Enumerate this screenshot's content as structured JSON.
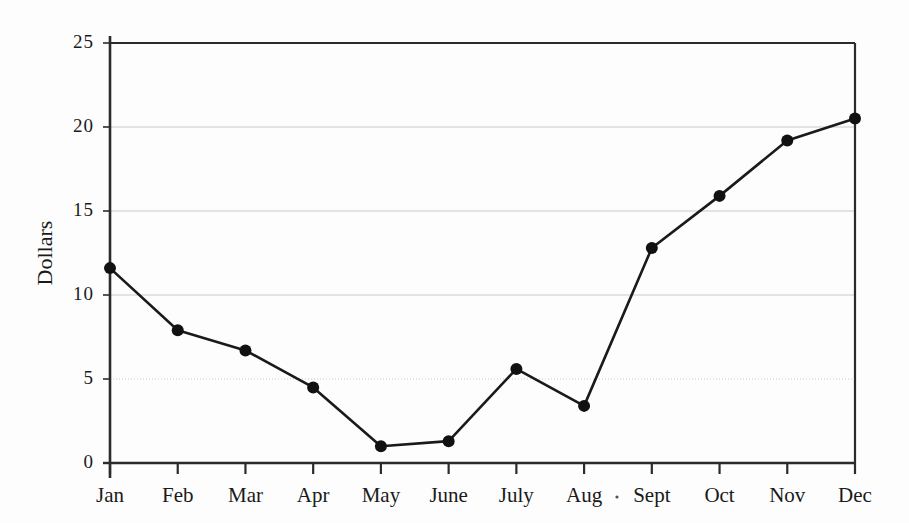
{
  "chart_data": {
    "type": "line",
    "title": "",
    "xlabel": "",
    "ylabel": "Dollars",
    "categories": [
      "Jan",
      "Feb",
      "Mar",
      "Apr",
      "May",
      "June",
      "July",
      "Aug",
      "Sept",
      "Oct",
      "Nov",
      "Dec"
    ],
    "values": [
      11.6,
      7.9,
      6.7,
      4.5,
      1.0,
      1.3,
      5.6,
      3.4,
      12.8,
      15.9,
      19.2,
      20.5
    ],
    "series": [
      {
        "name": "Dollars",
        "values": [
          11.6,
          7.9,
          6.7,
          4.5,
          1.0,
          1.3,
          5.6,
          3.4,
          12.8,
          15.9,
          19.2,
          20.5
        ]
      }
    ],
    "ylim": [
      0,
      25
    ],
    "yticks": [
      0,
      5,
      10,
      15,
      20,
      25
    ],
    "ytick_labels": [
      "0",
      "5",
      "10",
      "15",
      "20",
      "25"
    ],
    "grid": true,
    "gridlines_at": [
      5,
      10,
      15,
      20
    ],
    "legend": "none",
    "marker": "filled-circle",
    "line_color": "#1a1a1a",
    "marker_color": "#111111",
    "grid_color": "#c9c9c9",
    "axis_color": "#2b2b2b",
    "background": "#fdfdfd"
  },
  "layout": {
    "plot_left": 110,
    "plot_right": 855,
    "plot_top": 43,
    "plot_bottom": 463,
    "x_step": 67.73,
    "y_per_unit": 16.8
  }
}
